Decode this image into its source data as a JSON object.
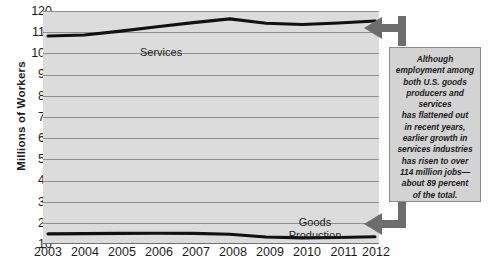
{
  "chart_data": {
    "type": "line",
    "title": "",
    "xlabel": "",
    "ylabel": "Millions of Workers",
    "ylim": [
      10,
      120
    ],
    "yticks": [
      10,
      20,
      30,
      40,
      50,
      60,
      70,
      80,
      90,
      100,
      110,
      120
    ],
    "grid": true,
    "legend": "inline-labels",
    "x": [
      "2003",
      "2004",
      "2005",
      "2006",
      "2007",
      "2008",
      "2009",
      "2010",
      "2011",
      "2012"
    ],
    "categories": [
      "2003",
      "2004",
      "2005",
      "2006",
      "2007",
      "2008",
      "2009",
      "2010",
      "2011",
      "2012"
    ],
    "series": [
      {
        "name": "Services",
        "values": [
          108.2,
          108.7,
          110.5,
          112.6,
          114.5,
          116.3,
          114.2,
          113.6,
          114.3,
          115.3
        ]
      },
      {
        "name": "Goods Production",
        "values": [
          14.8,
          14.9,
          15.0,
          15.1,
          15.0,
          14.6,
          13.3,
          12.9,
          13.1,
          13.4
        ]
      }
    ],
    "annotations": [
      {
        "name": "callout",
        "text": "Although employment among both U.S. goods producers and services has flattened out in recent years, earlier growth in services industries has risen to over 114 million jobs—about 89 percent of the total."
      }
    ]
  },
  "axes": {
    "y_title": "Millions of Workers",
    "y_tick_labels": [
      "120",
      "110",
      "100",
      "90",
      "80",
      "70",
      "60",
      "50",
      "40",
      "30",
      "20",
      "10"
    ],
    "x_tick_labels": [
      "2003",
      "2004",
      "2005",
      "2006",
      "2007",
      "2008",
      "2009",
      "2010",
      "2011",
      "2012"
    ]
  },
  "series_labels": {
    "services": "Services",
    "goods_line1": "Goods",
    "goods_line2": "Production"
  },
  "callout": {
    "text": "Although\nemployment among\nboth U.S. goods\nproducers and\nservices\nhas flattened out\nin recent years,\nearlier growth in\nservices industries\nhas risen to over\n114 million jobs—\nabout 89 percent\nof the total."
  },
  "colors": {
    "plot_background": "#dcdcdc",
    "gridline": "#8e8e8e",
    "series_line": "#111111",
    "callout_background": "#d3d3d3",
    "callout_border": "#8a8a8a",
    "arrow": "#6d6d6d",
    "text": "#1a1a1a"
  }
}
